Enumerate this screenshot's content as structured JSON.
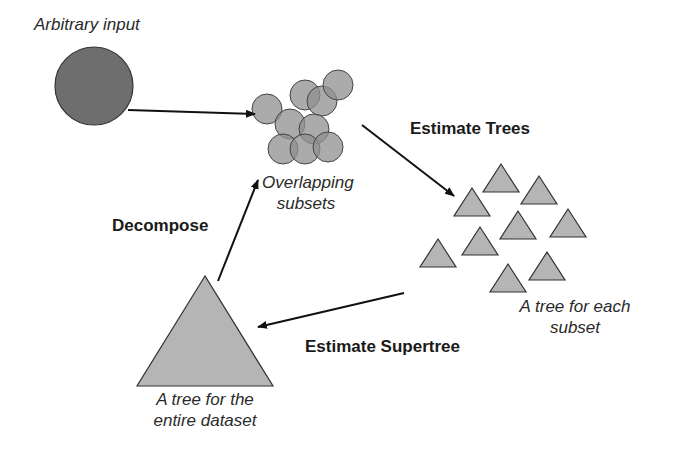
{
  "labels": {
    "input": "Arbitrary input",
    "subsets_line1": "Overlapping",
    "subsets_line2": "subsets",
    "estimate_trees": "Estimate Trees",
    "subset_trees_line1": "A tree for each",
    "subset_trees_line2": "subset",
    "estimate_supertree": "Estimate Supertree",
    "supertree_line1": "A tree for the",
    "supertree_line2": "entire dataset",
    "decompose": "Decompose"
  },
  "colors": {
    "input_circle": "#6e6e6e",
    "subset_circle": "#8f8f8f",
    "triangle": "#b5b5b5",
    "stroke": "#333333"
  },
  "nodes": {
    "input_circle": {
      "cx": 94,
      "cy": 86,
      "r": 39
    },
    "subset_circles": [
      {
        "cx": 267,
        "cy": 109,
        "r": 15
      },
      {
        "cx": 305,
        "cy": 95,
        "r": 15
      },
      {
        "cx": 322,
        "cy": 101,
        "r": 15
      },
      {
        "cx": 338,
        "cy": 85,
        "r": 15
      },
      {
        "cx": 290,
        "cy": 124,
        "r": 15
      },
      {
        "cx": 314,
        "cy": 129,
        "r": 15
      },
      {
        "cx": 283,
        "cy": 149,
        "r": 15
      },
      {
        "cx": 305,
        "cy": 149,
        "r": 15
      },
      {
        "cx": 328,
        "cy": 147,
        "r": 15
      }
    ],
    "subset_triangles": [
      {
        "x": 501,
        "y": 164,
        "w": 36,
        "h": 28
      },
      {
        "x": 539,
        "y": 176,
        "w": 36,
        "h": 28
      },
      {
        "x": 472,
        "y": 188,
        "w": 36,
        "h": 28
      },
      {
        "x": 518,
        "y": 211,
        "w": 36,
        "h": 28
      },
      {
        "x": 568,
        "y": 209,
        "w": 36,
        "h": 28
      },
      {
        "x": 480,
        "y": 227,
        "w": 36,
        "h": 28
      },
      {
        "x": 438,
        "y": 239,
        "w": 36,
        "h": 28
      },
      {
        "x": 547,
        "y": 252,
        "w": 36,
        "h": 28
      },
      {
        "x": 508,
        "y": 264,
        "w": 36,
        "h": 28
      }
    ],
    "supertree": {
      "x": 205,
      "y": 276,
      "w": 136,
      "h": 110
    }
  }
}
